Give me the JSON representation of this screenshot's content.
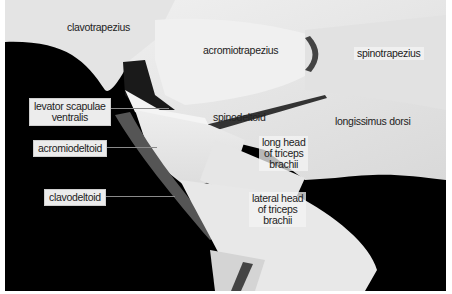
{
  "figure": {
    "colors": {
      "background": "#000000",
      "tissue": "#e9e9e9",
      "label_box": "#ececec",
      "leader_line": "#8a8a8a"
    },
    "labels": {
      "clavotrapezius": "clavotrapezius",
      "acromiotrapezius": "acromiotrapezius",
      "spinotrapezius": "spinotrapezius",
      "levator_scapulae_ventralis": "levator scapulae\nventralis",
      "spinodeltoid": "spinodeltoid",
      "longissimus_dorsi": "longissimus dorsi",
      "acromiodeltoid": "acromiodeltoid",
      "long_head_triceps": "long head\nof triceps\nbrachii",
      "clavodeltoid": "clavodeltoid",
      "lateral_head_triceps": "lateral head\nof triceps\nbrachii"
    }
  }
}
